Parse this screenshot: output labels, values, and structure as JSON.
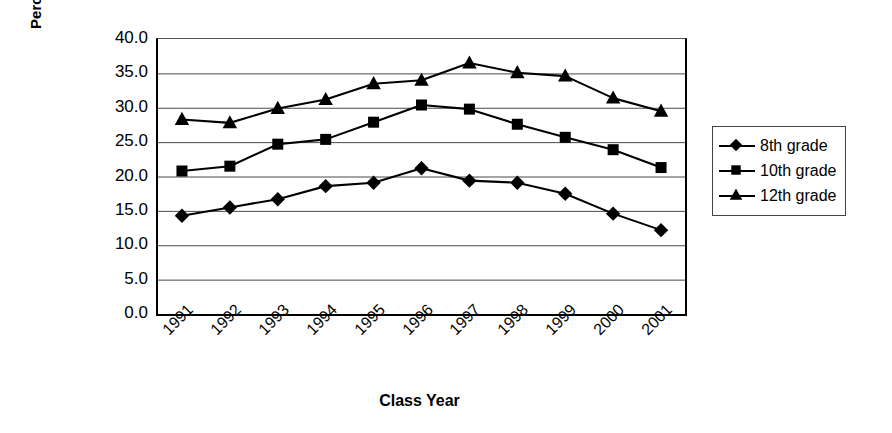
{
  "chart_data": {
    "type": "line",
    "title": "",
    "xlabel": "Class Year",
    "ylabel": "Percent Smoking in Past Month",
    "ylabel_lines": [
      "Percent Smoking in Past",
      "Month"
    ],
    "categories": [
      "1991",
      "1992",
      "1993",
      "1994",
      "1995",
      "1996",
      "1997",
      "1998",
      "1999",
      "2000",
      "2001"
    ],
    "ylim": [
      0.0,
      40.0
    ],
    "ytick_labels": [
      "40.0",
      "35.0",
      "30.0",
      "25.0",
      "20.0",
      "15.0",
      "10.0",
      "5.0",
      "0.0"
    ],
    "ytick_values": [
      40.0,
      35.0,
      30.0,
      25.0,
      20.0,
      15.0,
      10.0,
      5.0,
      0.0
    ],
    "grid": "horizontal",
    "legend_position": "right",
    "series": [
      {
        "name": "8th grade",
        "marker": "diamond",
        "color": "#000000",
        "values": [
          14.3,
          15.5,
          16.7,
          18.6,
          19.1,
          21.2,
          19.4,
          19.1,
          17.5,
          14.6,
          12.2
        ]
      },
      {
        "name": "10th grade",
        "marker": "square",
        "color": "#000000",
        "values": [
          20.8,
          21.5,
          24.7,
          25.4,
          27.9,
          30.4,
          29.8,
          27.6,
          25.7,
          23.9,
          21.3
        ]
      },
      {
        "name": "12th grade",
        "marker": "triangle",
        "color": "#000000",
        "values": [
          28.3,
          27.8,
          29.9,
          31.2,
          33.5,
          34.0,
          36.5,
          35.1,
          34.6,
          31.4,
          29.5
        ]
      }
    ]
  },
  "legend": {
    "items": [
      {
        "label": "8th grade",
        "marker": "diamond"
      },
      {
        "label": "10th grade",
        "marker": "square"
      },
      {
        "label": "12th grade",
        "marker": "triangle"
      }
    ]
  }
}
